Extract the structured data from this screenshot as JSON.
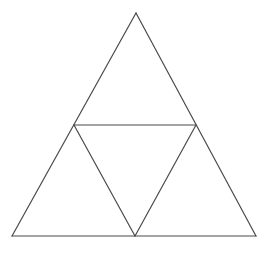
{
  "figure": {
    "kind": "geometry-diagram",
    "name": "subdivided-equilateral-triangle",
    "canvas": {
      "width": 273,
      "height": 259
    },
    "background_color": "#ffffff",
    "line_color": "#4a4a4a",
    "line_width": 1.2,
    "points": {
      "apex": {
        "x": 136,
        "y": 13
      },
      "bottom_left": {
        "x": 12,
        "y": 236
      },
      "bottom_right": {
        "x": 256,
        "y": 236
      },
      "mid_left": {
        "x": 74,
        "y": 125
      },
      "mid_right": {
        "x": 196,
        "y": 125
      },
      "mid_bottom": {
        "x": 135,
        "y": 236
      }
    },
    "outer_triangle": {
      "label": "outer-triangle",
      "path": "M 136 13 L 256 236 L 12 236 Z"
    },
    "segments": [
      {
        "label": "outer-left-side",
        "path": "M 136 13 L 12 236"
      },
      {
        "label": "outer-right-side",
        "path": "M 136 13 L 256 236"
      },
      {
        "label": "outer-base",
        "path": "M 12 236 L 256 236"
      },
      {
        "label": "midline-horizontal",
        "path": "M 74 125 L 196 125"
      },
      {
        "label": "midline-left-diagonal",
        "path": "M 74 125 L 135 236"
      },
      {
        "label": "midline-right-diagonal",
        "path": "M 196 125 L 135 236"
      }
    ],
    "regions": [
      {
        "label": "top-triangle",
        "path": "M 136 13 L 196 125 L 74 125 Z"
      },
      {
        "label": "left-triangle",
        "path": "M 74 125 L 135 236 L 12 236 Z"
      },
      {
        "label": "right-triangle",
        "path": "M 196 125 L 256 236 L 135 236 Z"
      },
      {
        "label": "center-inverted-triangle",
        "path": "M 74 125 L 196 125 L 135 236 Z"
      }
    ]
  }
}
